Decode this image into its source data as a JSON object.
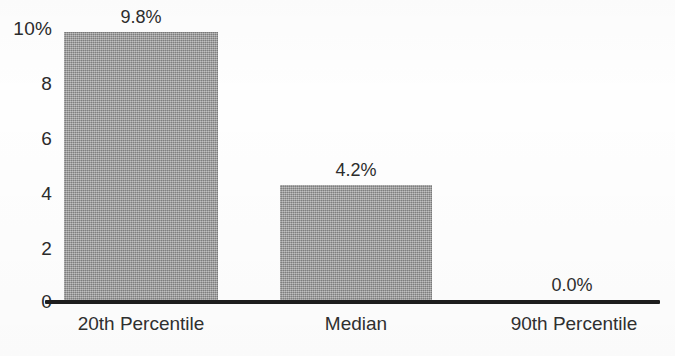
{
  "chart_data": {
    "type": "bar",
    "title": "",
    "subtitle": "",
    "xlabel": "",
    "ylabel": "",
    "categories": [
      "20th Percentile",
      "Median",
      "90th Percentile"
    ],
    "values": [
      9.8,
      4.2,
      0.0
    ],
    "data_labels": [
      "9.8%",
      "4.2%",
      "0.0%"
    ],
    "ylim": [
      0,
      10
    ],
    "y_ticks": [
      0,
      2,
      4,
      6,
      8,
      10
    ],
    "y_tick_labels": [
      "0",
      "2",
      "4",
      "6",
      "8",
      "10%"
    ],
    "grid": false,
    "legend": false,
    "legend_position": "none",
    "bar_color": "#9b9b9b",
    "axis_color": "#1d1d1d",
    "text_color": "#2d2d2d",
    "units": "percent"
  },
  "axis": {
    "ticks": [
      {
        "label": "10%",
        "value": 10
      },
      {
        "label": "8",
        "value": 8
      },
      {
        "label": "6",
        "value": 6
      },
      {
        "label": "4",
        "value": 4
      },
      {
        "label": "2",
        "value": 2
      },
      {
        "label": "0",
        "value": 0
      }
    ]
  },
  "bars": [
    {
      "category": "20th Percentile",
      "value": 9.8,
      "label": "9.8%"
    },
    {
      "category": "Median",
      "value": 4.2,
      "label": "4.2%"
    },
    {
      "category": "90th Percentile",
      "value": 0.0,
      "label": "0.0%"
    }
  ]
}
